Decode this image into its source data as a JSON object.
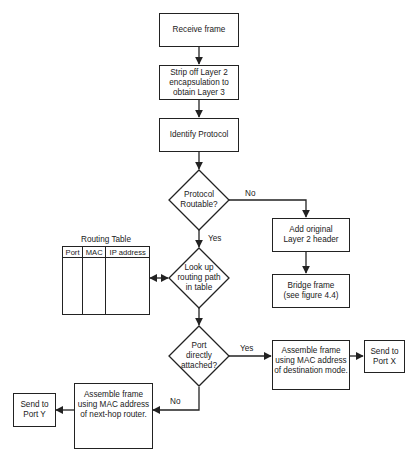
{
  "diagram": {
    "type": "flowchart",
    "nodes": {
      "receive_frame": {
        "label": "Receive frame",
        "shape": "process"
      },
      "strip_layer2": {
        "label": "Strip off Layer 2\nencapsulation to\nobtain Layer 3",
        "shape": "process"
      },
      "identify_protocol": {
        "label": "Identify Protocol",
        "shape": "process"
      },
      "protocol_routable": {
        "label": "Protocol\nRoutable?",
        "shape": "decision"
      },
      "add_layer2_header": {
        "label": "Add original\nLayer 2 header",
        "shape": "process"
      },
      "bridge_frame": {
        "label": "Bridge frame\n(see figure 4.4)",
        "shape": "process"
      },
      "lookup_routing": {
        "label": "Look up\nrouting path\nin table",
        "shape": "decision"
      },
      "port_attached": {
        "label": "Port\ndirectly\nattached?",
        "shape": "decision"
      },
      "assemble_dest": {
        "label": "Assemble frame\nusing MAC address\nof destination mode.",
        "shape": "process"
      },
      "send_port_x": {
        "label": "Send to\nPort X",
        "shape": "process"
      },
      "assemble_nexthop": {
        "label": "Assemble frame\nusing MAC address\nof next-hop router.",
        "shape": "process"
      },
      "send_port_y": {
        "label": "Send to\nPort Y",
        "shape": "process"
      }
    },
    "routing_table": {
      "title": "Routing Table",
      "columns": [
        "Port",
        "MAC",
        "IP address"
      ]
    },
    "edges": [
      {
        "from": "receive_frame",
        "to": "strip_layer2",
        "label": ""
      },
      {
        "from": "strip_layer2",
        "to": "identify_protocol",
        "label": ""
      },
      {
        "from": "identify_protocol",
        "to": "protocol_routable",
        "label": ""
      },
      {
        "from": "protocol_routable",
        "to": "add_layer2_header",
        "label": "No"
      },
      {
        "from": "add_layer2_header",
        "to": "bridge_frame",
        "label": ""
      },
      {
        "from": "protocol_routable",
        "to": "lookup_routing",
        "label": "Yes"
      },
      {
        "from": "lookup_routing",
        "to": "routing_table",
        "label": "",
        "bidirectional": true
      },
      {
        "from": "lookup_routing",
        "to": "port_attached",
        "label": ""
      },
      {
        "from": "port_attached",
        "to": "assemble_dest",
        "label": "Yes"
      },
      {
        "from": "assemble_dest",
        "to": "send_port_x",
        "label": ""
      },
      {
        "from": "port_attached",
        "to": "assemble_nexthop",
        "label": "No"
      },
      {
        "from": "assemble_nexthop",
        "to": "send_port_y",
        "label": ""
      }
    ],
    "edge_labels": {
      "routable_no": "No",
      "routable_yes": "Yes",
      "attached_yes": "Yes",
      "attached_no": "No"
    },
    "colors": {
      "stroke": "#222222",
      "fill": "#ffffff",
      "text": "#1a1a1a"
    }
  }
}
